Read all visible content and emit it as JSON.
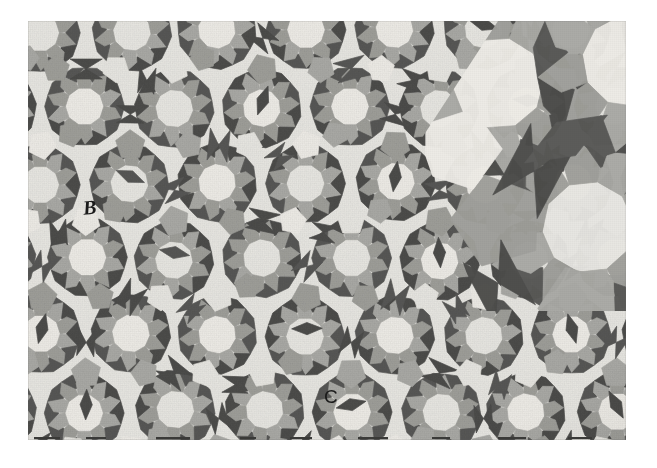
{
  "figure": {
    "kind": "quasiperiodic-tiling-plate",
    "labels": [
      {
        "id": "B",
        "text": "B",
        "x": 83,
        "y": 197,
        "style": "italic-serif"
      },
      {
        "id": "C",
        "text": "C",
        "x": 324,
        "y": 387,
        "style": "upright-sans"
      }
    ]
  },
  "plate": {
    "left": 28,
    "top": 21,
    "width": 598,
    "height": 419,
    "page_background": "#ffffff"
  },
  "palette": {
    "page": "#ffffff",
    "tile_light": "#e6e5e0",
    "tile_light_alt": "#eceae5",
    "tile_mid": "#a9a9a5",
    "tile_mid_alt": "#9e9e9a",
    "tile_dark": "#595957",
    "tile_dark_alt": "#4e4e4c",
    "ink": "#1b1b1b",
    "edge": "#6d6d6a"
  },
  "tiling": {
    "symmetry": "10-fold / pentagonal",
    "tile_types": [
      "pentagon",
      "bow-tie",
      "rhomb",
      "decagon-rosette"
    ],
    "tone_count": 3,
    "base_edge_px": 30,
    "inflated_edge_px": 78,
    "inflated_region": "upper-right"
  }
}
